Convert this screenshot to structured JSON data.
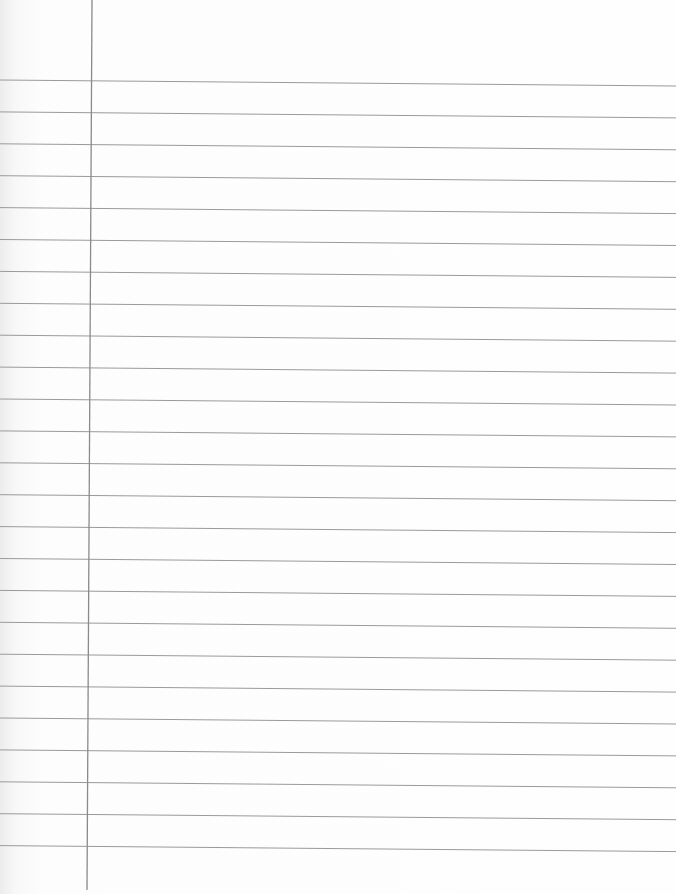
{
  "paper": {
    "type": "ruled notebook paper",
    "background": "#fdfdfd",
    "rule_color": "#9a9a9a",
    "margin_color": "#8a8a8a",
    "rule_count": 25,
    "first_rule_y_left": 80,
    "first_rule_y_right": 86,
    "rule_spacing": 31.9,
    "margin_x_top": 92,
    "margin_x_bottom": 87
  }
}
